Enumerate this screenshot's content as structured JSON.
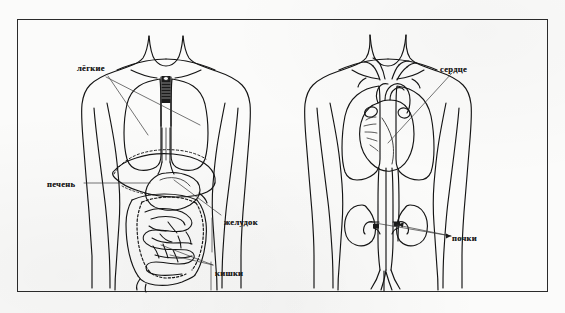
{
  "figure": {
    "type": "anatomical-diagram",
    "language": "ru",
    "border_color": "#2b2b2b",
    "ink_color": "#111111",
    "background_color": "#fbfbfa"
  },
  "left_figure": {
    "name": "digestive-and-respiratory-torso",
    "organs": [
      "lungs",
      "trachea",
      "liver",
      "stomach",
      "intestines"
    ]
  },
  "right_figure": {
    "name": "circulatory-and-urinary-torso",
    "organs": [
      "heart",
      "lungs",
      "aorta",
      "vena-cava",
      "kidneys",
      "ureters",
      "iliac-arteries"
    ]
  },
  "labels": {
    "lungs": "лёгкие",
    "liver": "печень",
    "stomach": "желудок",
    "intestines": "кишки",
    "heart": "сердце",
    "kidneys": "почки"
  }
}
